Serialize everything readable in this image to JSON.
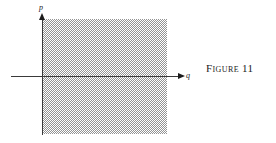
{
  "figure": {
    "caption_word": "Figure",
    "caption_number": "11",
    "axes": {
      "vertical_label": "p",
      "horizontal_label": "q"
    },
    "colors": {
      "ink": "#1c1c1c",
      "axis": "#3a3a3a",
      "shading": "#8a8a8a",
      "background": "#ffffff"
    }
  },
  "chart_data": {
    "type": "area",
    "xlabel": "q",
    "ylabel": "p",
    "grid": false,
    "legend": null,
    "regions": [
      {
        "name": "shaded-band",
        "fill": "hatched-gray",
        "q_range": [
          0,
          1
        ],
        "p_range": [
          -1,
          1
        ]
      }
    ],
    "x": [
      0,
      1
    ],
    "series": [
      {
        "name": "upper-bound",
        "values": [
          1,
          1
        ]
      },
      {
        "name": "lower-bound",
        "values": [
          -1,
          -1
        ]
      }
    ],
    "xlim": [
      -0.26,
      1.15
    ],
    "ylim": [
      -1.02,
      1.02
    ]
  }
}
